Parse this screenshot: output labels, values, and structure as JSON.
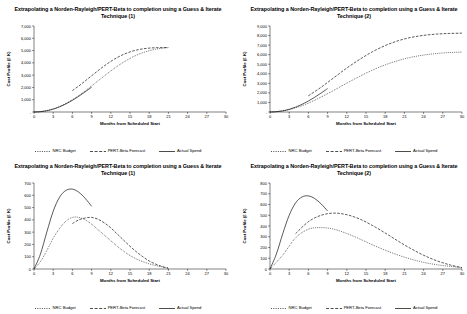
{
  "panels": [
    {
      "id": "top-left",
      "title": "Extrapolating a Norden-Rayleigh/PERT-Beta to completion using a Guess & Iterate Technique (1)",
      "xlabel": "Months from Scheduled Start",
      "ylabel": "Cost Profile (£ K)",
      "yticks": [
        "-",
        "1,000",
        "2,000",
        "3,000",
        "4,000",
        "5,000",
        "6,000",
        "7,000"
      ],
      "xticks": [
        "0",
        "3",
        "6",
        "9",
        "12",
        "15",
        "18",
        "21",
        "24",
        "27",
        "30"
      ],
      "legend": [
        "NRC Budget",
        "PERT-Beta Forecast",
        "Actual Spend"
      ]
    },
    {
      "id": "top-right",
      "title": "Extrapolating a Norden-Rayleigh/PERT-Beta to completion using a Guess & Iterate Technique (2)",
      "xlabel": "Months from Scheduled Start",
      "ylabel": "Cost Profile (£ K)",
      "yticks": [
        "-",
        "1,000",
        "2,000",
        "3,000",
        "4,000",
        "5,000",
        "6,000",
        "7,000",
        "8,000",
        "9,000"
      ],
      "xticks": [
        "0",
        "3",
        "6",
        "9",
        "12",
        "15",
        "18",
        "21",
        "24",
        "27",
        "30"
      ],
      "legend": [
        "NRC Budget",
        "PERT-Beta Forecast",
        "Actual Spend"
      ]
    },
    {
      "id": "bottom-left",
      "title": "Extrapolating a Norden-Rayleigh/PERT-Beta to completion using a Guess & Iterate Technique (1)",
      "xlabel": "Months from Scheduled Start",
      "ylabel": "Cost Profile (£ K)",
      "yticks": [
        "0",
        "100",
        "200",
        "300",
        "400",
        "500",
        "600",
        "700"
      ],
      "xticks": [
        "0",
        "3",
        "6",
        "9",
        "12",
        "15",
        "18",
        "21",
        "24",
        "27",
        "30"
      ],
      "legend": [
        "NRC Budget",
        "PERT-Beta Forecast",
        "Actual Spend"
      ]
    },
    {
      "id": "bottom-right",
      "title": "Extrapolating a Norden-Rayleigh/PERT-Beta to completion using a Guess & Iterate Technique (2)",
      "xlabel": "Months from Scheduled Start",
      "ylabel": "Cost Profile (£ K)",
      "yticks": [
        "0",
        "100",
        "200",
        "300",
        "400",
        "500",
        "600",
        "700",
        "800"
      ],
      "xticks": [
        "0",
        "3",
        "6",
        "9",
        "12",
        "15",
        "18",
        "21",
        "24",
        "27",
        "30"
      ],
      "legend": [
        "NRC Budget",
        "PERT-Beta Forecast",
        "Actual Spend"
      ]
    }
  ],
  "chart_data": [
    {
      "type": "line",
      "id": "top-left",
      "title": "Extrapolating a Norden-Rayleigh/PERT-Beta to completion using a Guess & Iterate Technique (1)",
      "xlabel": "Months from Scheduled Start",
      "ylabel": "Cost Profile (£ K)",
      "xlim": [
        0,
        30
      ],
      "ylim": [
        0,
        7000
      ],
      "grid": false,
      "legend_position": "bottom",
      "series": [
        {
          "name": "NRC Budget",
          "style": "dotted",
          "x": [
            0,
            1,
            2,
            3,
            4,
            5,
            6,
            7,
            8,
            9,
            10,
            11,
            12,
            13,
            14,
            15,
            16,
            17,
            18,
            19,
            20,
            21
          ],
          "values": [
            0,
            30,
            120,
            260,
            450,
            700,
            1000,
            1340,
            1720,
            2120,
            2530,
            2940,
            3340,
            3720,
            4060,
            4360,
            4620,
            4830,
            4990,
            5110,
            5190,
            5240
          ]
        },
        {
          "name": "PERT-Beta Forecast",
          "style": "dashed",
          "x": [
            6,
            7,
            8,
            9,
            10,
            11,
            12,
            13,
            14,
            15,
            16,
            17,
            18,
            19,
            20,
            21
          ],
          "values": [
            1750,
            2120,
            2530,
            2950,
            3360,
            3760,
            4120,
            4430,
            4690,
            4890,
            5040,
            5140,
            5200,
            5230,
            5240,
            5250
          ]
        },
        {
          "name": "Actual Spend",
          "style": "solid",
          "x": [
            0,
            1,
            2,
            3,
            4,
            5,
            6,
            7,
            8,
            9
          ],
          "values": [
            0,
            25,
            100,
            230,
            420,
            660,
            950,
            1280,
            1640,
            2020
          ]
        }
      ]
    },
    {
      "type": "line",
      "id": "top-right",
      "title": "Extrapolating a Norden-Rayleigh/PERT-Beta to completion using a Guess & Iterate Technique (2)",
      "xlabel": "Months from Scheduled Start",
      "ylabel": "Cost Profile (£ K)",
      "xlim": [
        0,
        30
      ],
      "ylim": [
        0,
        9000
      ],
      "grid": false,
      "legend_position": "bottom",
      "series": [
        {
          "name": "NRC Budget",
          "style": "dotted",
          "x": [
            0,
            2,
            4,
            6,
            8,
            10,
            12,
            14,
            16,
            18,
            20,
            22,
            24,
            26,
            28,
            30
          ],
          "values": [
            0,
            110,
            430,
            930,
            1570,
            2280,
            3020,
            3730,
            4380,
            4930,
            5380,
            5720,
            5960,
            6120,
            6220,
            6270
          ]
        },
        {
          "name": "PERT-Beta Forecast",
          "style": "dashed",
          "x": [
            6,
            8,
            10,
            12,
            14,
            16,
            18,
            20,
            22,
            24,
            26,
            28,
            30
          ],
          "values": [
            1700,
            2600,
            3600,
            4600,
            5500,
            6300,
            6950,
            7450,
            7800,
            8020,
            8150,
            8220,
            8250
          ]
        },
        {
          "name": "Actual Spend",
          "style": "solid",
          "x": [
            0,
            1,
            2,
            3,
            4,
            5,
            6,
            7,
            8,
            9
          ],
          "values": [
            0,
            30,
            120,
            280,
            510,
            800,
            1150,
            1550,
            1990,
            2450
          ]
        }
      ]
    },
    {
      "type": "line",
      "id": "bottom-left",
      "title": "Extrapolating a Norden-Rayleigh/PERT-Beta to completion using a Guess & Iterate Technique (1)",
      "xlabel": "Months from Scheduled Start",
      "ylabel": "Cost Profile (£ K)",
      "xlim": [
        0,
        30
      ],
      "ylim": [
        0,
        700
      ],
      "grid": false,
      "legend_position": "bottom",
      "series": [
        {
          "name": "NRC Budget",
          "style": "dotted",
          "x": [
            0,
            1,
            2,
            3,
            4,
            5,
            6,
            7,
            8,
            9,
            10,
            11,
            12,
            13,
            14,
            15,
            16,
            17,
            18,
            19,
            20,
            21
          ],
          "values": [
            0,
            60,
            150,
            250,
            330,
            390,
            420,
            420,
            400,
            365,
            320,
            275,
            230,
            185,
            145,
            110,
            82,
            60,
            42,
            28,
            18,
            10
          ]
        },
        {
          "name": "PERT-Beta Forecast",
          "style": "dashed",
          "x": [
            6,
            7,
            8,
            9,
            10,
            11,
            12,
            13,
            14,
            15,
            16,
            17,
            18,
            19,
            20,
            21
          ],
          "values": [
            370,
            400,
            415,
            420,
            405,
            375,
            335,
            285,
            235,
            185,
            140,
            100,
            65,
            40,
            20,
            5
          ]
        },
        {
          "name": "Actual Spend",
          "style": "solid",
          "x": [
            0,
            1,
            2,
            3,
            4,
            5,
            6,
            7,
            8,
            9
          ],
          "values": [
            0,
            120,
            300,
            470,
            585,
            640,
            650,
            625,
            575,
            510
          ]
        }
      ]
    },
    {
      "type": "line",
      "id": "bottom-right",
      "title": "Extrapolating a Norden-Rayleigh/PERT-Beta to completion using a Guess & Iterate Technique (2)",
      "xlabel": "Months from Scheduled Start",
      "ylabel": "Cost Profile (£ K)",
      "xlim": [
        0,
        30
      ],
      "ylim": [
        0,
        800
      ],
      "grid": false,
      "legend_position": "bottom",
      "series": [
        {
          "name": "NRC Budget",
          "style": "dotted",
          "x": [
            0,
            2,
            4,
            6,
            8,
            10,
            12,
            14,
            16,
            18,
            20,
            22,
            24,
            26,
            28,
            30
          ],
          "values": [
            0,
            130,
            290,
            370,
            385,
            370,
            330,
            280,
            225,
            175,
            130,
            92,
            62,
            40,
            25,
            14
          ]
        },
        {
          "name": "PERT-Beta Forecast",
          "style": "dashed",
          "x": [
            4,
            6,
            8,
            10,
            12,
            14,
            16,
            18,
            20,
            22,
            24,
            26,
            28,
            30
          ],
          "values": [
            330,
            440,
            500,
            520,
            505,
            465,
            405,
            335,
            260,
            190,
            128,
            78,
            40,
            12
          ]
        },
        {
          "name": "Actual Spend",
          "style": "solid",
          "x": [
            0,
            1,
            2,
            3,
            4,
            5,
            6,
            7,
            8,
            9
          ],
          "values": [
            0,
            140,
            330,
            500,
            615,
            670,
            680,
            655,
            605,
            540
          ]
        }
      ]
    }
  ]
}
